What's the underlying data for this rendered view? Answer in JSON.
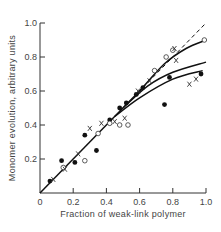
{
  "chart_data": {
    "type": "scatter",
    "title": "",
    "xlabel": "Fraction of weak-link polymer",
    "ylabel": "Monomer evolution, arbitrary units",
    "xlim": [
      0,
      1.0
    ],
    "ylim": [
      0,
      1.0
    ],
    "xticks": [
      "0",
      "0.2",
      "0.4",
      "0.6",
      "0.8",
      "1.0"
    ],
    "yticks": [
      "0.2",
      "0.4",
      "0.6",
      "0.8",
      "1.0"
    ],
    "grid": false,
    "legend": null,
    "series": [
      {
        "name": "filled circles",
        "marker": "filled-circle",
        "points": [
          [
            0.06,
            0.07
          ],
          [
            0.13,
            0.19
          ],
          [
            0.21,
            0.18
          ],
          [
            0.27,
            0.34
          ],
          [
            0.34,
            0.25
          ],
          [
            0.42,
            0.43
          ],
          [
            0.48,
            0.5
          ],
          [
            0.52,
            0.53
          ],
          [
            0.58,
            0.58
          ],
          [
            0.62,
            0.62
          ],
          [
            0.75,
            0.52
          ],
          [
            0.78,
            0.68
          ],
          [
            0.97,
            0.7
          ]
        ]
      },
      {
        "name": "open circles",
        "marker": "open-circle",
        "points": [
          [
            0.14,
            0.15
          ],
          [
            0.27,
            0.19
          ],
          [
            0.35,
            0.35
          ],
          [
            0.42,
            0.41
          ],
          [
            0.48,
            0.4
          ],
          [
            0.53,
            0.4
          ],
          [
            0.69,
            0.72
          ],
          [
            0.76,
            0.8
          ],
          [
            0.8,
            0.84
          ],
          [
            0.99,
            0.9
          ]
        ]
      },
      {
        "name": "crosses",
        "marker": "x",
        "points": [
          [
            0.08,
            0.08
          ],
          [
            0.15,
            0.14
          ],
          [
            0.23,
            0.23
          ],
          [
            0.3,
            0.38
          ],
          [
            0.37,
            0.41
          ],
          [
            0.45,
            0.42
          ],
          [
            0.51,
            0.44
          ],
          [
            0.59,
            0.6
          ],
          [
            0.66,
            0.66
          ],
          [
            0.81,
            0.85
          ],
          [
            0.94,
            0.67
          ],
          [
            0.82,
            0.78
          ],
          [
            0.9,
            0.64
          ]
        ]
      }
    ],
    "lines": [
      {
        "name": "ideal",
        "style": "solid-then-dashed",
        "points": [
          [
            0,
            0
          ],
          [
            0.62,
            0.62
          ],
          [
            1.0,
            1.0
          ]
        ]
      },
      {
        "name": "upper curve",
        "style": "solid",
        "points": [
          [
            0.6,
            0.6
          ],
          [
            0.75,
            0.76
          ],
          [
            0.88,
            0.85
          ],
          [
            1.0,
            0.9
          ]
        ]
      },
      {
        "name": "middle curve",
        "style": "solid",
        "points": [
          [
            0.5,
            0.5
          ],
          [
            0.65,
            0.63
          ],
          [
            0.8,
            0.71
          ],
          [
            1.0,
            0.77
          ]
        ]
      },
      {
        "name": "lower curve",
        "style": "solid",
        "points": [
          [
            0.45,
            0.45
          ],
          [
            0.6,
            0.56
          ],
          [
            0.8,
            0.67
          ],
          [
            0.98,
            0.72
          ]
        ]
      }
    ]
  }
}
